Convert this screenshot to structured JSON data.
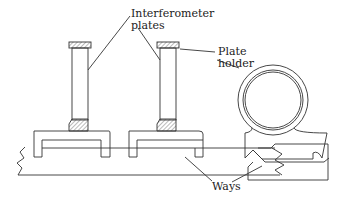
{
  "diagram": {
    "labels": {
      "interferometer_plates_line1": "Interferometer",
      "interferometer_plates_line2": "plates",
      "plate_holder_line1": "Plate",
      "plate_holder_line2": "holder",
      "ways": "Ways"
    },
    "colors": {
      "stroke": "#333333",
      "background": "#ffffff"
    }
  }
}
